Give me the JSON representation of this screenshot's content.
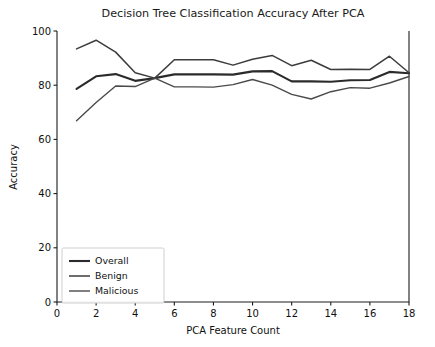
{
  "chart_data": {
    "type": "line",
    "title": "Decision Tree Classification Accuracy After PCA",
    "xlabel": "PCA Feature Count",
    "ylabel": "Accuracy",
    "xlim": [
      0,
      18
    ],
    "ylim": [
      0,
      100
    ],
    "xticks": [
      0,
      2,
      4,
      6,
      8,
      10,
      12,
      14,
      16,
      18
    ],
    "yticks": [
      0,
      20,
      40,
      60,
      80,
      100
    ],
    "grid": false,
    "legend_position": "lower left",
    "x": [
      1,
      2,
      3,
      4,
      5,
      6,
      7,
      8,
      9,
      10,
      11,
      12,
      13,
      14,
      15,
      16,
      17,
      18
    ],
    "series": [
      {
        "name": "Overall",
        "color": "#2b2b2b",
        "width": 2.1,
        "values": [
          78.6,
          83.3,
          84.1,
          81.6,
          82.6,
          84.0,
          84.0,
          84.0,
          83.9,
          85.1,
          85.2,
          81.4,
          81.4,
          81.3,
          81.8,
          81.9,
          84.9,
          84.4
        ]
      },
      {
        "name": "Benign",
        "color": "#3c3c3c",
        "width": 1.5,
        "values": [
          93.4,
          96.6,
          92.2,
          84.6,
          82.6,
          89.4,
          89.4,
          89.4,
          87.4,
          89.6,
          91.0,
          87.2,
          89.2,
          85.8,
          85.9,
          85.8,
          90.7,
          84.6
        ]
      },
      {
        "name": "Malicious",
        "color": "#4a4a4a",
        "width": 1.4,
        "values": [
          66.9,
          73.6,
          79.7,
          79.5,
          82.6,
          79.4,
          79.4,
          79.3,
          80.2,
          82.1,
          80.0,
          76.6,
          74.9,
          77.6,
          79.1,
          78.9,
          80.8,
          83.2
        ]
      }
    ]
  },
  "legend": {
    "items": [
      {
        "label": "Overall"
      },
      {
        "label": "Benign"
      },
      {
        "label": "Malicious"
      }
    ]
  },
  "axes": {
    "xtick_labels": [
      "0",
      "2",
      "4",
      "6",
      "8",
      "10",
      "12",
      "14",
      "16",
      "18"
    ],
    "ytick_labels": [
      "0",
      "20",
      "40",
      "60",
      "80",
      "100"
    ]
  },
  "colors": {
    "background": "#ffffff",
    "axis": "#1c1c1c",
    "text": "#101010"
  }
}
